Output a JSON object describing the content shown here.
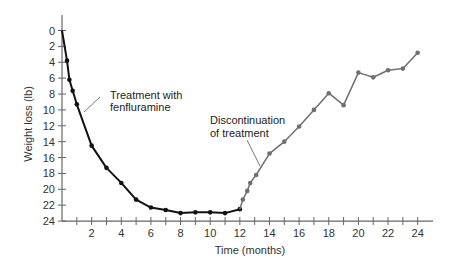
{
  "chart_data": {
    "type": "line",
    "title": "",
    "xlabel": "Time (months)",
    "ylabel": "Weight loss (lb)",
    "xlim": [
      0,
      25
    ],
    "ylim": [
      0,
      24
    ],
    "y_inverted": true,
    "grid": false,
    "legend": null,
    "x_ticks": [
      1,
      2,
      3,
      4,
      5,
      6,
      7,
      8,
      9,
      10,
      11,
      12,
      13,
      14,
      15,
      16,
      17,
      18,
      19,
      20,
      21,
      22,
      23,
      24
    ],
    "x_tick_labels": [
      "2",
      "4",
      "6",
      "8",
      "10",
      "12",
      "14",
      "16",
      "18",
      "20",
      "22",
      "24"
    ],
    "y_tick_labels": [
      "0",
      "2",
      "4",
      "6",
      "8",
      "10",
      "12",
      "14",
      "16",
      "18",
      "20",
      "22",
      "24"
    ],
    "series": [
      {
        "name": "Treatment with fenfluramine",
        "color": "#111111",
        "x": [
          0,
          0.34,
          0.5,
          0.72,
          1.0,
          2.0,
          3.0,
          4.0,
          5.0,
          6.0,
          7.0,
          8.0,
          9.0,
          10.0,
          11.0,
          12.0
        ],
        "y": [
          0,
          3.8,
          6.2,
          7.6,
          9.3,
          14.5,
          17.3,
          19.2,
          21.3,
          22.3,
          22.6,
          23.0,
          22.9,
          22.9,
          23.0,
          22.5
        ]
      },
      {
        "name": "Discontinuation of treatment",
        "color": "#707070",
        "x": [
          12.0,
          12.2,
          12.5,
          12.7,
          13.1,
          14.0,
          15.0,
          16.0,
          17.0,
          18.0,
          19.0,
          20.0,
          21.0,
          22.0,
          23.0,
          24.0
        ],
        "y": [
          22.5,
          21.3,
          20.2,
          19.2,
          18.2,
          15.5,
          14.0,
          12.1,
          10.0,
          7.9,
          9.4,
          5.3,
          5.9,
          5.0,
          4.8,
          2.8
        ]
      }
    ],
    "annotations": [
      {
        "lines": [
          "Treatment with",
          "fenfluramine"
        ],
        "points_to": [
          1.3,
          11
        ]
      },
      {
        "lines": [
          "Discontinuation",
          "of treatment"
        ],
        "points_to": [
          13.3,
          17.2
        ]
      }
    ]
  }
}
